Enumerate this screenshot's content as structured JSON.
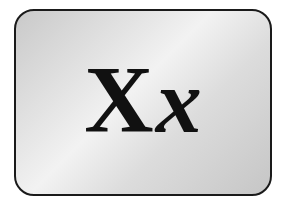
{
  "card": {
    "uppercase_letter": "X",
    "lowercase_letter": "x",
    "colors": {
      "border": "#1a1a1a",
      "background_light": "#f2f2f2",
      "background_dark": "#c6c6c6",
      "text": "#111111"
    }
  }
}
